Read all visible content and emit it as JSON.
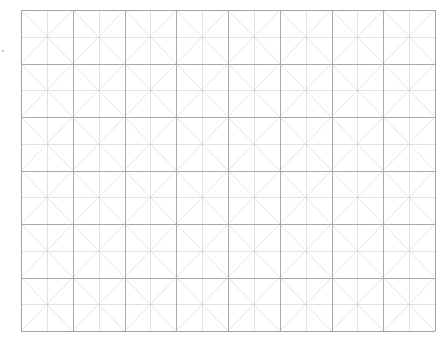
{
  "practice_grid": {
    "type": "mi-zi-ge",
    "columns": 8,
    "rows": 6,
    "origin": {
      "x": 21,
      "y": 10
    },
    "size": {
      "width": 414,
      "height": 321
    },
    "colors": {
      "background": "#ffffff",
      "cell_border": "#a9a9a9",
      "midline": "#e2e2e2",
      "diagonal": "#e6e6e6",
      "outer_border": "#a3a3a3"
    }
  }
}
